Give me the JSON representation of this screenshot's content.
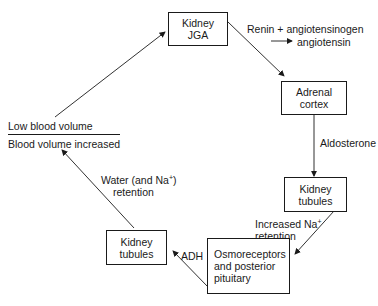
{
  "diagram": {
    "nodes": {
      "kidney_jga": {
        "line1": "Kidney",
        "line2": "JGA"
      },
      "adrenal_cortex": {
        "line1": "Adrenal",
        "line2": "cortex"
      },
      "kidney_tubules_right": {
        "line1": "Kidney",
        "line2": "tubules"
      },
      "osmoreceptors": {
        "line1": "Osmoreceptors",
        "line2": "and posterior",
        "line3": "pituitary"
      },
      "kidney_tubules_left": {
        "line1": "Kidney",
        "line2": "tubules"
      }
    },
    "edge_labels": {
      "renin_line1": "Renin + angiotensinogen",
      "renin_line2": "angiotensin",
      "aldosterone": "Aldosterone",
      "increased_na_line1": "Increased Na",
      "increased_na_sup": "+",
      "increased_na_line2": "retention",
      "adh": "ADH",
      "water_line1": "Water (and Na",
      "water_sup": "+",
      "water_close": ")",
      "water_line2": "retention"
    },
    "state": {
      "top": "Low blood volume",
      "bottom": "Blood volume increased"
    },
    "edges": [
      {
        "from": "state",
        "to": "kidney_jga"
      },
      {
        "from": "kidney_jga",
        "to": "adrenal_cortex"
      },
      {
        "from": "adrenal_cortex",
        "to": "kidney_tubules_right"
      },
      {
        "from": "kidney_tubules_right",
        "to": "osmoreceptors"
      },
      {
        "from": "osmoreceptors",
        "to": "kidney_tubules_left"
      },
      {
        "from": "kidney_tubules_left",
        "to": "state"
      }
    ]
  }
}
